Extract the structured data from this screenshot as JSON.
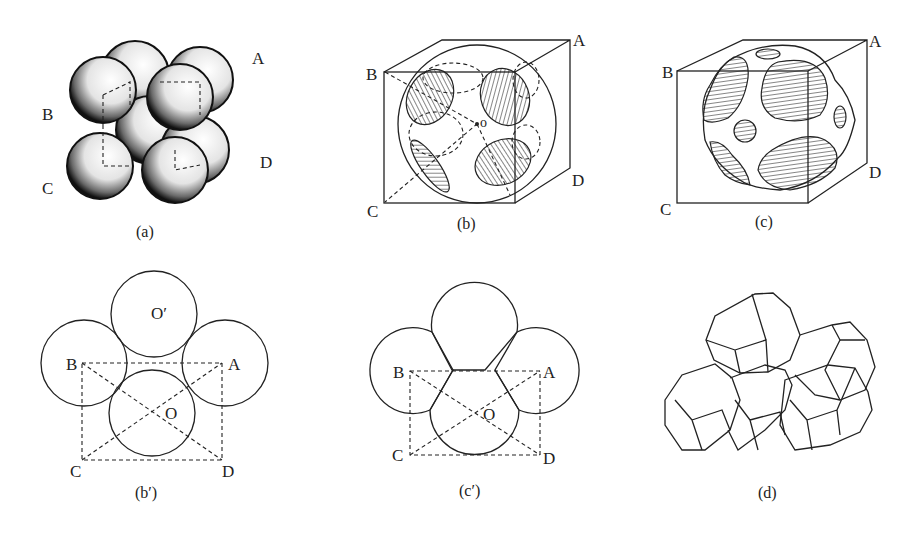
{
  "figure": {
    "panels": [
      {
        "id": "a",
        "caption": "(a)",
        "description": "packed spheres",
        "points": {
          "A": "A",
          "B": "B",
          "C": "C",
          "D": "D"
        }
      },
      {
        "id": "b",
        "caption": "(b)",
        "description": "sphere in cube with circular contact faces",
        "points": {
          "A": "A",
          "B": "B",
          "C": "C",
          "D": "D",
          "O": "o"
        }
      },
      {
        "id": "c",
        "caption": "(c)",
        "description": "deformed sphere in cube with flattened faces",
        "points": {
          "A": "A",
          "B": "B",
          "C": "C",
          "D": "D"
        }
      },
      {
        "id": "b_prime",
        "caption": "(b′)",
        "description": "cross-section of touching circles",
        "points": {
          "A": "A",
          "B": "B",
          "C": "C",
          "D": "D",
          "O": "O",
          "O_prime": "O′"
        }
      },
      {
        "id": "c_prime",
        "caption": "(c′)",
        "description": "cross-section of overlapping circles",
        "points": {
          "A": "A",
          "B": "B",
          "C": "C",
          "D": "D",
          "O": "O"
        }
      },
      {
        "id": "d",
        "caption": "(d)",
        "description": "tetrakaidecahedra packing"
      }
    ]
  }
}
